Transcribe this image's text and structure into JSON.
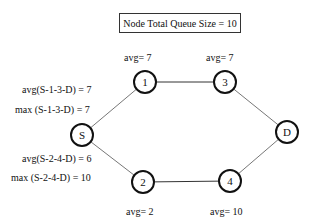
{
  "title": "Node Total Queue Size = 10",
  "nodes": {
    "S": {
      "label": "S"
    },
    "n1": {
      "label": "1",
      "avg": "avg= 7"
    },
    "n3": {
      "label": "3",
      "avg": "avg= 7"
    },
    "n2": {
      "label": "2",
      "avg": "avg= 2"
    },
    "n4": {
      "label": "4",
      "avg": "avg= 10"
    },
    "D": {
      "label": "D"
    }
  },
  "paths": {
    "upper_avg": "avg(S-1-3-D) = 7",
    "upper_max": "max (S-1-3-D) = 7",
    "lower_avg": "avg(S-2-4-D) = 6",
    "lower_max": "max (S-2-4-D) = 10"
  },
  "edges": [
    [
      "S",
      "1"
    ],
    [
      "1",
      "3"
    ],
    [
      "3",
      "D"
    ],
    [
      "S",
      "2"
    ],
    [
      "2",
      "4"
    ],
    [
      "4",
      "D"
    ]
  ]
}
